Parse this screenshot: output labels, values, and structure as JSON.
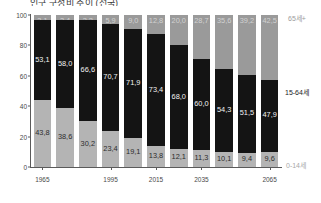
{
  "figure": {
    "title_fragment": "인구 구성비 추이 (전국)",
    "legend": {
      "old": "65세+",
      "working": "15-64세",
      "young": "0-14세"
    }
  },
  "chart_data": {
    "type": "bar",
    "title": "인구 구성비 추이 (전국)",
    "xlabel": "",
    "ylabel": "",
    "ylim": [
      0,
      100
    ],
    "yticks": [
      "0",
      "20",
      "40",
      "60",
      "80",
      "100"
    ],
    "grid": false,
    "stacked": true,
    "legend_position": "right",
    "categories": [
      "1965",
      "1975",
      "1985",
      "1995",
      "2005",
      "2015",
      "2025",
      "2035",
      "2045",
      "2055",
      "2065"
    ],
    "xtick_labels": [
      "1965",
      "1995",
      "2015",
      "2035",
      "2065"
    ],
    "series": [
      {
        "name": "0-14세",
        "color": "#b4b4b4",
        "values": [
          43.8,
          38.6,
          30.2,
          23.4,
          19.1,
          13.8,
          12.1,
          11.3,
          10.1,
          9.4,
          9.6
        ],
        "labels": [
          "43,8",
          "38,6",
          "30,2",
          "23,4",
          "19,1",
          "13,8",
          "12,1",
          "11,3",
          "10,1",
          "9,4",
          "9,6"
        ]
      },
      {
        "name": "15-64세",
        "color": "#141414",
        "values": [
          53.1,
          58.0,
          66.6,
          70.7,
          71.9,
          73.4,
          68.0,
          60.0,
          54.3,
          51.5,
          47.9
        ],
        "labels": [
          "53,1",
          "58,0",
          "66,6",
          "70,7",
          "71,9",
          "73,4",
          "68,0",
          "60,0",
          "54,3",
          "51,5",
          "47,9"
        ]
      },
      {
        "name": "65세+",
        "color": "#9a9a9a",
        "values": [
          3.1,
          3.4,
          3.2,
          5.9,
          9.0,
          12.8,
          20.0,
          28.7,
          35.6,
          39.2,
          42.5
        ],
        "labels": [
          "3,1",
          "3,4",
          "3,2",
          "5,9",
          "9,0",
          "12,8",
          "20,0",
          "28,7",
          "35,6",
          "39,2",
          "42,5"
        ]
      }
    ]
  }
}
